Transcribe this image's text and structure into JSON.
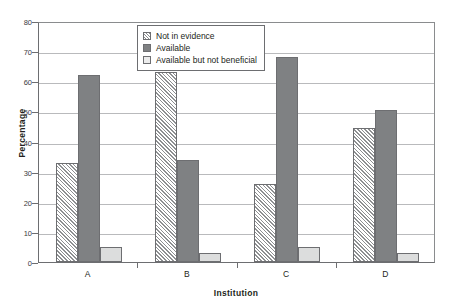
{
  "chart_data": {
    "type": "bar",
    "title": "",
    "xlabel": "Institution",
    "ylabel": "Percentage",
    "categories": [
      "A",
      "B",
      "C",
      "D"
    ],
    "series": [
      {
        "name": "Not in evidence",
        "values": [
          33,
          63,
          26,
          44.5
        ],
        "swatch": "hatch"
      },
      {
        "name": "Available",
        "values": [
          62,
          34,
          68,
          50.5
        ],
        "swatch": "dark"
      },
      {
        "name": "Available but not beneficial",
        "values": [
          5,
          3,
          5,
          3
        ],
        "swatch": "light"
      }
    ],
    "ylim": [
      0,
      80
    ],
    "yticks": [
      0,
      10,
      20,
      30,
      40,
      50,
      60,
      70,
      80
    ],
    "ytick_labels": [
      "0",
      "10",
      "20",
      "30",
      "40",
      "50",
      "60",
      "70",
      "80"
    ],
    "grid": true,
    "legend_position": "upper-center-left",
    "colors": {
      "hatch_line": "#8d8f91",
      "dark": "#7f8183",
      "light": "#dcdddd",
      "axis": "#6d6e71",
      "grid": "#b9babc",
      "text": "#231f20",
      "background": "#ffffff"
    }
  }
}
